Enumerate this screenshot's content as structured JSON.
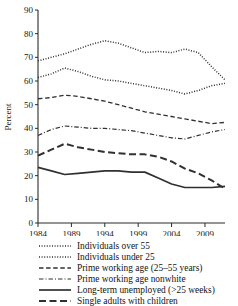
{
  "chart_data": {
    "type": "line",
    "title": "",
    "xlabel": "",
    "ylabel": "Percent",
    "xlim": [
      1984,
      2012
    ],
    "ylim": [
      0,
      90
    ],
    "yticks": [
      0,
      10,
      20,
      30,
      40,
      50,
      60,
      70,
      80,
      90
    ],
    "xticks": [
      1984,
      1989,
      1994,
      1999,
      2004,
      2009
    ],
    "xtick_labels": [
      "1984",
      "1989",
      "1994",
      "1999",
      "2004",
      "2009"
    ],
    "ytick_labels": [
      "0",
      "10",
      "20",
      "30",
      "40",
      "50",
      "60",
      "70",
      "80",
      "90"
    ],
    "grid": false,
    "legend_position": "below",
    "x": [
      1984,
      1986,
      1988,
      1990,
      1992,
      1994,
      1996,
      1998,
      2000,
      2002,
      2004,
      2006,
      2008,
      2010,
      2012
    ],
    "series": [
      {
        "name": "Individuals over 55",
        "style": "dotted",
        "values": [
          68.5,
          70.0,
          71.5,
          73.5,
          75.5,
          77.0,
          76.0,
          74.0,
          72.0,
          72.5,
          72.0,
          73.5,
          72.0,
          66.0,
          60.5
        ]
      },
      {
        "name": "Individuals under 25",
        "style": "dotted",
        "values": [
          61.5,
          63.0,
          65.5,
          64.0,
          62.0,
          60.5,
          60.0,
          59.0,
          58.0,
          57.0,
          56.0,
          54.5,
          56.0,
          58.0,
          59.0
        ]
      },
      {
        "name": "Prime working age (25–55 years)",
        "style": "dashed",
        "values": [
          52.5,
          53.0,
          54.0,
          53.5,
          52.5,
          51.5,
          50.0,
          48.5,
          47.0,
          46.0,
          45.0,
          44.0,
          43.0,
          42.0,
          42.5
        ]
      },
      {
        "name": "Prime working age nonwhite",
        "style": "dash-dot",
        "values": [
          37.0,
          39.5,
          41.0,
          40.5,
          40.0,
          40.0,
          39.5,
          39.0,
          38.0,
          37.0,
          36.0,
          35.5,
          37.0,
          38.5,
          39.5
        ]
      },
      {
        "name": "Long-term unemployed (>25 weeks)",
        "style": "solid",
        "values": [
          23.5,
          22.0,
          20.5,
          21.0,
          21.5,
          22.0,
          22.0,
          21.5,
          21.5,
          19.0,
          16.5,
          15.0,
          15.0,
          15.0,
          15.5
        ]
      },
      {
        "name": "Single adults with children",
        "style": "long-dash",
        "values": [
          28.5,
          31.0,
          33.5,
          32.0,
          31.0,
          30.0,
          29.5,
          29.0,
          29.0,
          28.0,
          26.0,
          23.0,
          21.0,
          18.0,
          14.5
        ]
      }
    ]
  },
  "legend": {
    "items": [
      {
        "label": "Individuals over 55",
        "style": "dotted"
      },
      {
        "label": "Individuals under 25",
        "style": "dotted"
      },
      {
        "label": "Prime working age (25–55 years)",
        "style": "dashed"
      },
      {
        "label": "Prime working age nonwhite",
        "style": "dash-dot"
      },
      {
        "label": "Long-term unemployed (>25 weeks)",
        "style": "solid"
      },
      {
        "label": "Single adults with children",
        "style": "long-dash"
      }
    ]
  }
}
